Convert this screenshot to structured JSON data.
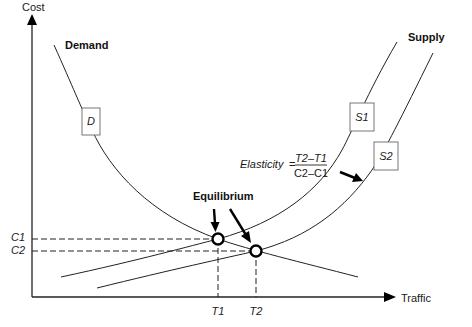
{
  "axes": {
    "y_label": "Cost",
    "x_label": "Traffic"
  },
  "curves": {
    "demand_title": "Demand",
    "supply_title": "Supply",
    "demand_box": "D",
    "supply1_box": "S1",
    "supply2_box": "S2"
  },
  "equilibrium": {
    "label": "Equilibrium"
  },
  "ticks": {
    "c1": "C1",
    "c2": "C2",
    "t1": "T1",
    "t2": "T2"
  },
  "elasticity": {
    "label": "Elasticity",
    "equals": "=",
    "numerator": "T2–T1",
    "denominator": "C2–C1"
  },
  "colors": {
    "line": "#222222",
    "box_border": "#777777",
    "background": "#ffffff"
  }
}
